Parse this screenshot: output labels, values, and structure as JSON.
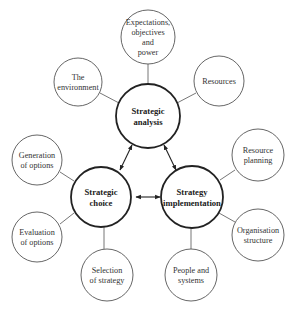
{
  "diagram": {
    "type": "strategic-management-model",
    "core_nodes": {
      "analysis": {
        "label_lines": [
          "Strategic",
          "analysis"
        ]
      },
      "choice": {
        "label_lines": [
          "Strategic",
          "choice"
        ]
      },
      "implementation": {
        "label_lines": [
          "Strategy",
          "implementation"
        ]
      }
    },
    "analysis_satellites": [
      {
        "id": "environment",
        "label_lines": [
          "The",
          "environment"
        ]
      },
      {
        "id": "expectations",
        "label_lines": [
          "Expectations,",
          "objectives",
          "and",
          "power"
        ]
      },
      {
        "id": "resources",
        "label_lines": [
          "Resources"
        ]
      }
    ],
    "choice_satellites": [
      {
        "id": "generation",
        "label_lines": [
          "Generation",
          "of options"
        ]
      },
      {
        "id": "evaluation",
        "label_lines": [
          "Evaluation",
          "of options"
        ]
      },
      {
        "id": "selection",
        "label_lines": [
          "Selection",
          "of strategy"
        ]
      }
    ],
    "implementation_satellites": [
      {
        "id": "resource-planning",
        "label_lines": [
          "Resource",
          "planning"
        ]
      },
      {
        "id": "organisation",
        "label_lines": [
          "Organisation",
          "structure"
        ]
      },
      {
        "id": "people",
        "label_lines": [
          "People and",
          "systems"
        ]
      }
    ],
    "links": [
      {
        "from": "analysis",
        "to": "choice",
        "style": "double-arrow"
      },
      {
        "from": "analysis",
        "to": "implementation",
        "style": "double-arrow"
      },
      {
        "from": "choice",
        "to": "implementation",
        "style": "double-arrow"
      }
    ]
  }
}
